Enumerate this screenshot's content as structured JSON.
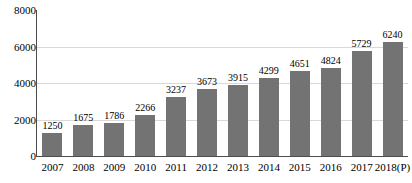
{
  "chart_data": {
    "type": "bar",
    "title": "",
    "xlabel": "",
    "ylabel": "",
    "categories": [
      "2007",
      "2008",
      "2009",
      "2010",
      "2011",
      "2012",
      "2013",
      "2014",
      "2015",
      "2016",
      "2017",
      "2018(P)"
    ],
    "values": [
      1250,
      1675,
      1786,
      2266,
      3237,
      3673,
      3915,
      4299,
      4651,
      4824,
      5729,
      6240
    ],
    "data_labels": [
      "1250",
      "1675",
      "1786",
      "2266",
      "3237",
      "3673",
      "3915",
      "4299",
      "4651",
      "4824",
      "5729",
      "6240"
    ],
    "ylim": [
      0,
      8000
    ],
    "yticks": [
      0,
      2000,
      4000,
      6000,
      8000
    ],
    "ytick_labels": [
      "0",
      "2000",
      "4000",
      "6000",
      "8000"
    ],
    "gridlines": [
      2000,
      4000,
      6000
    ],
    "grid": true,
    "legend": null,
    "legend_position": "none",
    "series": [
      {
        "name": "",
        "values": [
          1250,
          1675,
          1786,
          2266,
          3237,
          3673,
          3915,
          4299,
          4651,
          4824,
          5729,
          6240
        ]
      }
    ],
    "colors": {
      "bar_fill": "#737373",
      "axis": "#4d4d4d",
      "gridline": "#d9d9d9",
      "text": "#000000",
      "background": "#ffffff"
    }
  }
}
